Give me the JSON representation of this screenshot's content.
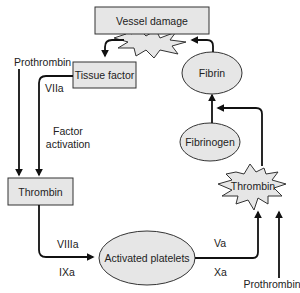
{
  "diagram": {
    "colors": {
      "shape_fill": "#e6e6e6",
      "stroke": "#333333",
      "arrow": "#111111",
      "text": "#222222"
    },
    "nodes": {
      "vessel_damage": {
        "label": "Vessel damage",
        "shape": "rectangle-with-starburst"
      },
      "tissue_factor": {
        "label": "Tissue factor",
        "shape": "rectangle"
      },
      "thrombin_box": {
        "label": "Thrombin",
        "shape": "rectangle"
      },
      "activated_platelets": {
        "label": "Activated platelets",
        "shape": "ellipse"
      },
      "thrombin_burst": {
        "label": "Thrombin",
        "shape": "starburst"
      },
      "fibrinogen": {
        "label": "Fibrinogen",
        "shape": "ellipse"
      },
      "fibrin": {
        "label": "Fibrin",
        "shape": "ellipse"
      }
    },
    "labels": {
      "prothrombin_top": "Prothrombin",
      "prothrombin_bottom": "Prothrombin",
      "viia": "VIIa",
      "factor_activation_1": "Factor",
      "factor_activation_2": "activation",
      "viiia": "VIIIa",
      "ixa": "IXa",
      "va": "Va",
      "xa": "Xa"
    },
    "edges": [
      {
        "from": "vessel_damage",
        "to": "tissue_factor"
      },
      {
        "from": "prothrombin_top",
        "to": "thrombin_box"
      },
      {
        "from": "tissue_factor",
        "to": "thrombin_box",
        "label": "VIIa"
      },
      {
        "from": "thrombin_box",
        "to": "activated_platelets",
        "labels": [
          "VIIIa",
          "IXa"
        ]
      },
      {
        "from": "activated_platelets",
        "to": "thrombin_burst",
        "labels": [
          "Va",
          "Xa"
        ]
      },
      {
        "from": "prothrombin_bottom",
        "to": "thrombin_burst"
      },
      {
        "from": "thrombin_burst",
        "to": "fibrin"
      },
      {
        "from": "fibrinogen",
        "to": "fibrin"
      },
      {
        "from": "fibrin",
        "to": "vessel_damage"
      }
    ]
  }
}
